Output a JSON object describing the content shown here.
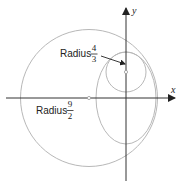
{
  "diagram": {
    "axes": {
      "x_label": "x",
      "y_label": "y",
      "color": "#333333"
    },
    "shapes": {
      "large_circle": {
        "radius_label_word": "Radius",
        "radius_numerator": "9",
        "radius_denominator": "2",
        "color": "#b8b8b8"
      },
      "small_circle": {
        "radius_label_word": "Radius",
        "radius_numerator": "4",
        "radius_denominator": "3",
        "color": "#b8b8b8"
      },
      "oval": {
        "color": "#b8b8b8"
      }
    },
    "annotation_arrow_color": "#222222"
  }
}
